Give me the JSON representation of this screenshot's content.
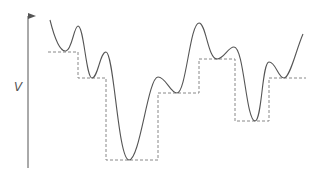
{
  "diagram": {
    "type": "energy-landscape",
    "axis_label": "V",
    "colors": {
      "curve": "#555555",
      "steps": "#888888",
      "axis": "#555555"
    },
    "axis": {
      "x": 28,
      "y_top": 8,
      "y_bottom": 168
    },
    "curve_path": "M50,20 C55,40 60,52 66,51 C72,50 74,26 78,26 C84,26 86,78 92,78 C98,78 100,52 106,52 C114,52 118,160 129,160 C140,160 148,77 158,77 C166,77 170,93 177,93 C186,93 190,23 199,23 C206,23 208,59 217,59 C224,59 228,47 234,47 C244,47 246,121 255,121 C262,121 262,62 269,62 C276,62 278,78 284,78 C290,78 296,50 303,34",
    "steps": [
      {
        "x1": 48,
        "x2": 78,
        "y": 52
      },
      {
        "x1": 78,
        "x2": 106,
        "y": 78
      },
      {
        "x1": 106,
        "x2": 158,
        "y": 160
      },
      {
        "x1": 158,
        "x2": 199,
        "y": 93
      },
      {
        "x1": 199,
        "x2": 235,
        "y": 59
      },
      {
        "x1": 235,
        "x2": 269,
        "y": 121
      },
      {
        "x1": 269,
        "x2": 306,
        "y": 78
      }
    ]
  }
}
